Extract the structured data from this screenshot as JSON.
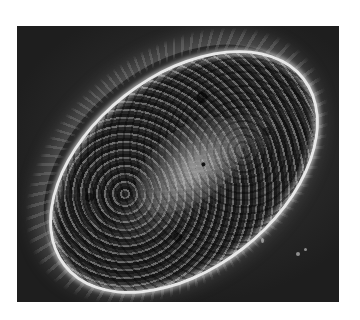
{
  "image": {
    "subject": "paramecium",
    "description": "Phase-contrast micrograph of an elongated oval single-celled ciliate with a bright rim, mottled dark interior, and radiating cilia on a dark gray background",
    "colors": {
      "page_background": "#ffffff",
      "photo_background": "#2a2a2a",
      "cell_rim": "#e8e8e8",
      "cell_interior": "#3c3c3c"
    }
  }
}
